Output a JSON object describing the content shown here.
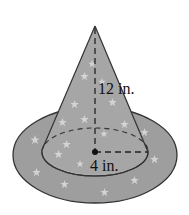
{
  "figure": {
    "labels": {
      "height": "12 in.",
      "radius": "4 in."
    },
    "colors": {
      "fill": "#a8a8a8",
      "brim": "#9a9a9a",
      "stroke": "#333333",
      "star": "#d8d8d8"
    }
  }
}
